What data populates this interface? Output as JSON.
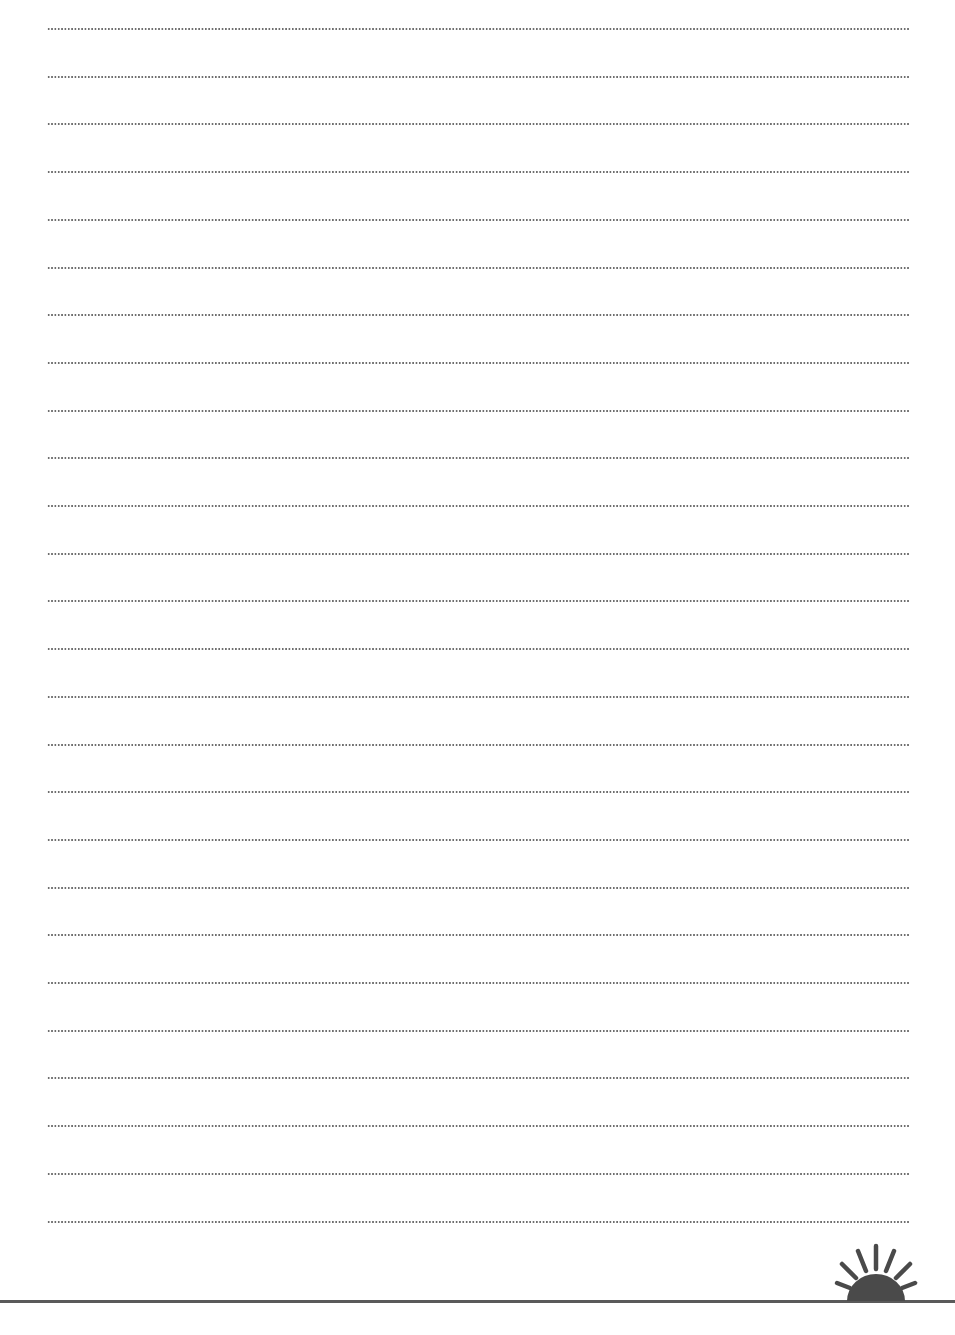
{
  "page": {
    "type": "lined-writing-paper",
    "line_count": 26,
    "first_line_y": 28,
    "line_spacing": 47.7,
    "line_color": "#6e6e6e",
    "rule_color": "#5a5a5a",
    "background": "#ffffff"
  },
  "decoration": {
    "icon": "rising-sun-icon",
    "color": "#4a4a4a"
  }
}
